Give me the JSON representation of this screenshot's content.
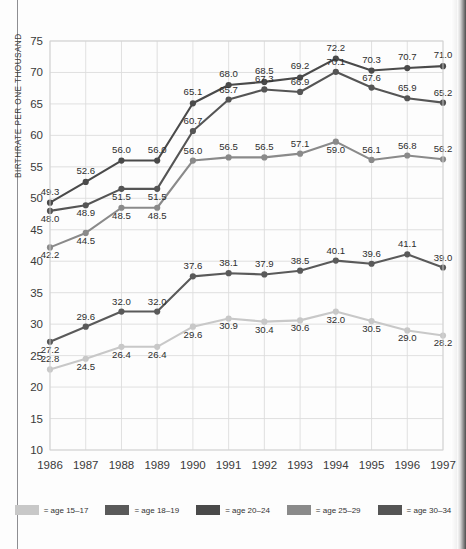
{
  "axes": {
    "ylabel": "BIRTHRATE PER ONE THOUSAND",
    "yticks": [
      "75",
      "70",
      "65",
      "60",
      "55",
      "50",
      "45",
      "40",
      "35",
      "30",
      "25",
      "20",
      "15",
      "10"
    ],
    "xticks": [
      "1986",
      "1987",
      "1988",
      "1989",
      "1990",
      "1991",
      "1992",
      "1993",
      "1994",
      "1995",
      "1996",
      "1997"
    ]
  },
  "legend": {
    "items": [
      {
        "label": "= age 15–17",
        "color": "#c8c8c8"
      },
      {
        "label": "= age 18–19",
        "color": "#5a5a5a"
      },
      {
        "label": "= age 20–24",
        "color": "#4a4a4a"
      },
      {
        "label": "= age 25–29",
        "color": "#8a8a8a"
      },
      {
        "label": "= age 30–34",
        "color": "#555555"
      }
    ]
  },
  "chart_data": {
    "type": "line",
    "title": "",
    "xlabel": "",
    "ylabel": "BIRTHRATE PER ONE THOUSAND",
    "ylim": [
      10,
      75
    ],
    "ytick_step": 5,
    "grid": true,
    "legend_position": "bottom",
    "categories": [
      "1986",
      "1987",
      "1988",
      "1989",
      "1990",
      "1991",
      "1992",
      "1993",
      "1994",
      "1995",
      "1996",
      "1997"
    ],
    "series": [
      {
        "name": "age 15–17",
        "color": "#c8c8c8",
        "values": [
          22.8,
          24.5,
          26.4,
          26.4,
          29.6,
          30.9,
          30.4,
          30.6,
          32.0,
          30.5,
          29.0,
          28.2
        ],
        "labels": [
          "22.8",
          "24.5",
          "26.4",
          "26.4",
          "29.6",
          "30.9",
          "30.4",
          "30.6",
          "32.0",
          "30.5",
          "29.0",
          "28.2"
        ]
      },
      {
        "name": "age 18–19",
        "color": "#5a5a5a",
        "values": [
          27.2,
          29.6,
          32.0,
          32.0,
          37.6,
          38.1,
          37.9,
          38.5,
          40.1,
          39.6,
          41.1,
          39.0
        ],
        "labels": [
          "27.2",
          "29.6",
          "32.0",
          "32.0",
          "37.6",
          "38.1",
          "37.9",
          "38.5",
          "40.1",
          "39.6",
          "41.1",
          "39.0"
        ]
      },
      {
        "name": "age 20–24",
        "color": "#4a4a4a",
        "values": [
          49.3,
          52.6,
          56.0,
          56.0,
          65.1,
          68.0,
          68.5,
          69.2,
          72.2,
          70.3,
          70.7,
          71.0
        ],
        "labels": [
          "49.3",
          "52.6",
          "56.0",
          "56.0",
          "65.1",
          "68.0",
          "68.5",
          "69.2",
          "72.2",
          "70.3",
          "70.7",
          "71.0"
        ]
      },
      {
        "name": "age 25–29",
        "color": "#8a8a8a",
        "values": [
          42.2,
          44.5,
          48.5,
          48.5,
          56.0,
          56.5,
          56.5,
          57.1,
          59.0,
          56.1,
          56.8,
          56.2
        ],
        "labels": [
          "42.2",
          "44.5",
          "48.5",
          "48.5",
          "56.0",
          "56.5",
          "56.5",
          "57.1",
          "59.0",
          "56.1",
          "56.8",
          "56.2"
        ]
      },
      {
        "name": "age 30–34",
        "color": "#555555",
        "values": [
          48.0,
          48.9,
          51.5,
          51.5,
          60.7,
          65.7,
          67.3,
          66.9,
          70.1,
          67.6,
          65.9,
          65.2
        ],
        "labels": [
          "48.0",
          "48.9",
          "51.5",
          "51.5",
          "60.7",
          "65.7",
          "67.3",
          "66.9",
          "70.1",
          "67.6",
          "65.9",
          "65.2"
        ]
      }
    ]
  }
}
